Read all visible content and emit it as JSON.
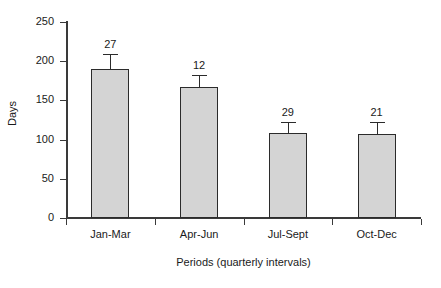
{
  "chart_data": {
    "type": "bar",
    "title": "",
    "subtitle": "",
    "categories": [
      "Jan-Mar",
      "Apr-Jun",
      "Jul-Sept",
      "Oct-Dec"
    ],
    "values": [
      190,
      167,
      109,
      107
    ],
    "errors": [
      19,
      15,
      13,
      15
    ],
    "point_labels": [
      "27",
      "12",
      "29",
      "21"
    ],
    "xlabel": "Periods (quarterly intervals)",
    "ylabel": "Days",
    "ylim": [
      0,
      250
    ],
    "yticks": [
      0,
      50,
      100,
      150,
      200,
      250
    ],
    "ytick_labels": [
      "0",
      "50",
      "100",
      "150",
      "200",
      "250"
    ],
    "grid": false,
    "legend": false,
    "legend_position": "none",
    "bar_fill_color": "#d4d4d4",
    "bar_edge_color": "#2b2b2b",
    "axis_color": "#3a3a3a",
    "text_color": "#1a1a1a",
    "background_color": "#ffffff",
    "series": [
      {
        "name": "Days",
        "values": [
          190,
          167,
          109,
          107
        ],
        "errors": [
          19,
          15,
          13,
          15
        ],
        "labels": [
          "27",
          "12",
          "29",
          "21"
        ]
      }
    ]
  }
}
